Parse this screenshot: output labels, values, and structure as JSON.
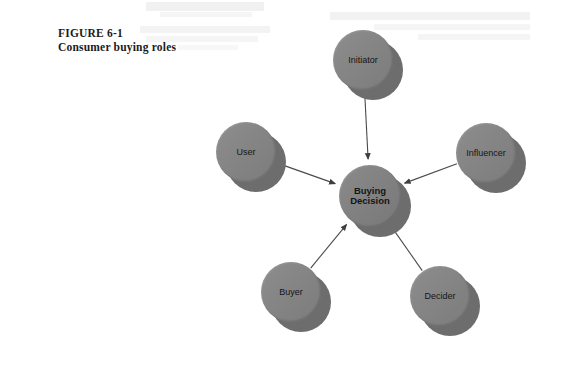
{
  "figure": {
    "caption_line1": "FIGURE 6-1",
    "caption_line2": "Consumer buying roles"
  },
  "colors": {
    "background": "#ffffff",
    "node_face": "#858585",
    "node_shadow": "#6d6d6d",
    "edge": "#4a4a4a",
    "text": "#151515",
    "caption_text": "#1b1b1b"
  },
  "chart_data": {
    "type": "diagram",
    "title": "Consumer buying roles",
    "layout": "radial-hub-and-spoke",
    "center": {
      "id": "buying-decision",
      "label": "Buying\nDecision",
      "cx": 370,
      "cy": 196,
      "r": 31
    },
    "nodes": [
      {
        "id": "initiator",
        "label": "Initiator",
        "cx": 363,
        "cy": 60,
        "r": 30,
        "angle_deg": 90
      },
      {
        "id": "influencer",
        "label": "Influencer",
        "cx": 486,
        "cy": 153,
        "r": 30,
        "angle_deg": 20
      },
      {
        "id": "decider",
        "label": "Decider",
        "cx": 440,
        "cy": 296,
        "r": 30,
        "angle_deg": -55
      },
      {
        "id": "buyer",
        "label": "Buyer",
        "cx": 291,
        "cy": 292,
        "r": 30,
        "angle_deg": -120
      },
      {
        "id": "user",
        "label": "User",
        "cx": 246,
        "cy": 152,
        "r": 30,
        "angle_deg": 150
      }
    ],
    "edges": [
      {
        "from": "initiator",
        "to": "buying-decision",
        "arrow": "to-center"
      },
      {
        "from": "influencer",
        "to": "buying-decision",
        "arrow": "to-center"
      },
      {
        "from": "decider",
        "to": "buying-decision",
        "arrow": "to-center"
      },
      {
        "from": "buyer",
        "to": "buying-decision",
        "arrow": "to-center"
      },
      {
        "from": "user",
        "to": "buying-decision",
        "arrow": "to-center"
      }
    ]
  }
}
